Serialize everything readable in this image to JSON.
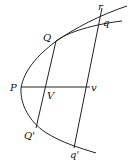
{
  "diagram": {
    "labels": {
      "r": "r",
      "q": "q",
      "Q": "Q",
      "P": "P",
      "V": "V",
      "v": "v",
      "Q_prime": "Q'",
      "q_prime": "q'"
    },
    "colors": {
      "stroke": "#222222",
      "text": "#111111",
      "background": "#ffffff"
    }
  }
}
